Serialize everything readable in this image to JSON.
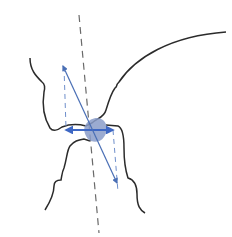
{
  "diagram": {
    "type": "anatomical-line-drawing",
    "colors": {
      "background": "#ffffff",
      "outline": "#2b2b2b",
      "axis_dashed": "#6a6a6a",
      "vector": "#4a6fb5",
      "contact_blob": "#8a9cc9",
      "horizontal_arrow": "#3d67c4"
    },
    "elements": [
      {
        "id": "upper-bone-outline",
        "kind": "outline"
      },
      {
        "id": "lower-bone-outline",
        "kind": "outline"
      },
      {
        "id": "long-axis",
        "kind": "dashed-line"
      },
      {
        "id": "diagonal-vector",
        "kind": "double-arrow"
      },
      {
        "id": "horizontal-vector",
        "kind": "double-arrow"
      },
      {
        "id": "contact-region",
        "kind": "filled-shape"
      },
      {
        "id": "projection-left",
        "kind": "dashed-line"
      },
      {
        "id": "projection-right",
        "kind": "dashed-line"
      }
    ]
  }
}
